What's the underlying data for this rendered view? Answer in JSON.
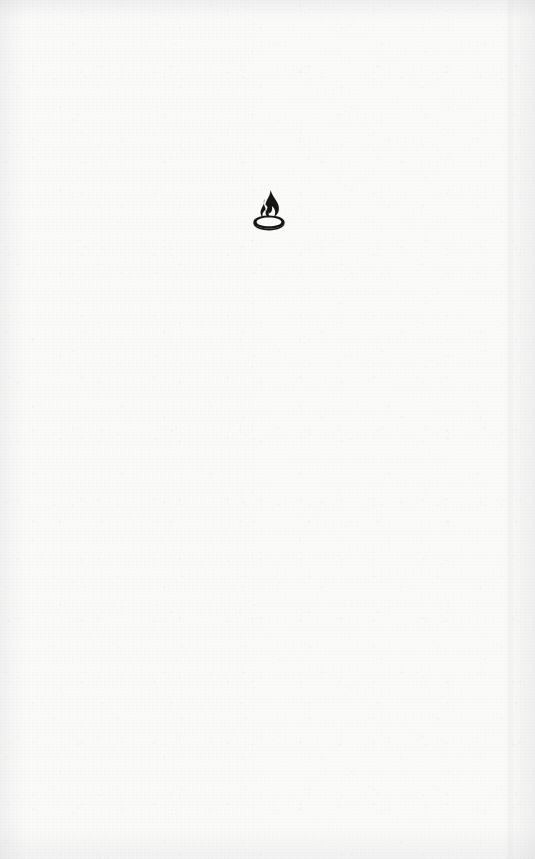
{
  "page": {
    "kind": "scanned-book-page",
    "width": 535,
    "height": 859,
    "paper_color": "#fbfbfa",
    "ink_color": "#151515",
    "body_text": "",
    "header_text": "",
    "footer_text": "",
    "page_number": ""
  },
  "emblem": {
    "name": "flame-brazier-emblem",
    "description": "Flame rising from an oval brazier bowl",
    "icon": "flame-icon",
    "base_icon": "brazier-bowl-icon",
    "color": "#151515",
    "center_x": 268,
    "center_y": 211
  }
}
